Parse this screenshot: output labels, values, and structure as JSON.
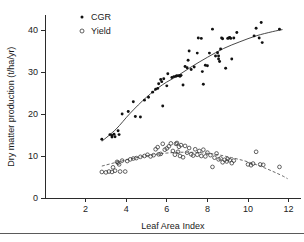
{
  "figure": {
    "background": "#ffffff",
    "frame_color": "#2b2b2b",
    "footer_rule_color": "#5a5a5a"
  },
  "chart_data": {
    "type": "scatter",
    "title": "",
    "xlabel": "Leaf Area Index",
    "ylabel": "Dry matter production (t/ha/yr)",
    "xlim": [
      0,
      12.6
    ],
    "ylim": [
      0,
      43.5
    ],
    "xticks": [
      2,
      4,
      6,
      8,
      10,
      12
    ],
    "yticks": [
      0,
      10,
      20,
      30,
      40
    ],
    "xtick_labels": [
      "2",
      "4",
      "6",
      "8",
      "10",
      "12"
    ],
    "ytick_labels": [
      "0",
      "10",
      "20",
      "30",
      "40"
    ],
    "grid": false,
    "legend_position": "top-left",
    "legend": [
      {
        "label": "CGR",
        "marker": "filled-circle",
        "color": "#111111"
      },
      {
        "label": "Yield",
        "marker": "open-circle",
        "color": "#3a3a3a"
      }
    ],
    "series": [
      {
        "name": "CGR",
        "marker": "filled-circle",
        "color": "#111111",
        "points": [
          [
            2.8,
            14.0
          ],
          [
            3.2,
            15.1
          ],
          [
            3.3,
            14.9
          ],
          [
            3.3,
            14.5
          ],
          [
            3.4,
            15.2
          ],
          [
            3.45,
            14.6
          ],
          [
            3.6,
            16.0
          ],
          [
            3.65,
            15.1
          ],
          [
            3.8,
            20.0
          ],
          [
            4.1,
            20.6
          ],
          [
            4.35,
            22.9
          ],
          [
            4.45,
            19.4
          ],
          [
            4.7,
            19.3
          ],
          [
            4.9,
            23.3
          ],
          [
            5.1,
            24.0
          ],
          [
            5.3,
            25.2
          ],
          [
            5.45,
            25.9
          ],
          [
            5.55,
            26.1
          ],
          [
            5.6,
            27.2
          ],
          [
            5.7,
            28.2
          ],
          [
            5.75,
            27.7
          ],
          [
            5.8,
            21.9
          ],
          [
            5.85,
            28.4
          ],
          [
            6.0,
            26.7
          ],
          [
            6.05,
            29.6
          ],
          [
            6.25,
            28.7
          ],
          [
            6.35,
            28.9
          ],
          [
            6.45,
            29.0
          ],
          [
            6.5,
            29.1
          ],
          [
            6.6,
            29.1
          ],
          [
            6.65,
            29.0
          ],
          [
            6.7,
            29.2
          ],
          [
            6.8,
            26.9
          ],
          [
            6.9,
            31.3
          ],
          [
            7.0,
            31.0
          ],
          [
            7.05,
            32.8
          ],
          [
            7.1,
            35.0
          ],
          [
            7.2,
            30.6
          ],
          [
            7.35,
            31.2
          ],
          [
            7.5,
            34.5
          ],
          [
            7.55,
            38.1
          ],
          [
            7.7,
            38.0
          ],
          [
            7.75,
            30.1
          ],
          [
            7.8,
            27.1
          ],
          [
            7.9,
            31.6
          ],
          [
            8.0,
            31.5
          ],
          [
            8.1,
            34.5
          ],
          [
            8.25,
            40.2
          ],
          [
            8.4,
            33.8
          ],
          [
            8.5,
            34.6
          ],
          [
            8.55,
            33.8
          ],
          [
            8.55,
            33.1
          ],
          [
            8.6,
            32.5
          ],
          [
            8.65,
            35.5
          ],
          [
            8.7,
            38.1
          ],
          [
            8.75,
            37.9
          ],
          [
            8.9,
            30.9
          ],
          [
            9.0,
            38.0
          ],
          [
            9.05,
            38.1
          ],
          [
            9.1,
            38.2
          ],
          [
            9.15,
            38.0
          ],
          [
            9.2,
            33.1
          ],
          [
            9.3,
            38.1
          ],
          [
            9.45,
            39.4
          ],
          [
            10.3,
            38.6
          ],
          [
            10.4,
            40.4
          ],
          [
            10.55,
            38.1
          ],
          [
            10.65,
            41.8
          ],
          [
            10.7,
            37.0
          ],
          [
            11.55,
            40.2
          ]
        ],
        "fit_curve_style": "solid",
        "fit_curve": [
          [
            2.8,
            13.5
          ],
          [
            3.5,
            16.4
          ],
          [
            4.2,
            20.2
          ],
          [
            5.0,
            24.0
          ],
          [
            5.8,
            27.0
          ],
          [
            6.5,
            29.0
          ],
          [
            7.2,
            31.2
          ],
          [
            8.0,
            33.5
          ],
          [
            8.8,
            35.6
          ],
          [
            9.6,
            37.2
          ],
          [
            10.4,
            38.6
          ],
          [
            11.2,
            39.6
          ],
          [
            11.7,
            40.1
          ]
        ]
      },
      {
        "name": "Yield",
        "marker": "open-circle",
        "color": "#3a3a3a",
        "points": [
          [
            2.8,
            6.2
          ],
          [
            3.0,
            6.1
          ],
          [
            3.15,
            6.3
          ],
          [
            3.3,
            6.2
          ],
          [
            3.35,
            7.3
          ],
          [
            3.45,
            6.5
          ],
          [
            3.55,
            8.6
          ],
          [
            3.6,
            8.4
          ],
          [
            3.65,
            8.0
          ],
          [
            3.7,
            6.3
          ],
          [
            3.8,
            8.9
          ],
          [
            3.95,
            6.3
          ],
          [
            4.05,
            8.8
          ],
          [
            4.2,
            9.2
          ],
          [
            4.35,
            9.4
          ],
          [
            4.5,
            9.5
          ],
          [
            4.7,
            9.8
          ],
          [
            4.9,
            10.0
          ],
          [
            5.05,
            10.3
          ],
          [
            5.2,
            9.9
          ],
          [
            5.35,
            10.2
          ],
          [
            5.45,
            11.6
          ],
          [
            5.55,
            12.1
          ],
          [
            5.6,
            10.4
          ],
          [
            5.7,
            10.5
          ],
          [
            5.8,
            12.9
          ],
          [
            5.9,
            11.5
          ],
          [
            6.0,
            11.8
          ],
          [
            6.1,
            12.3
          ],
          [
            6.2,
            13.0
          ],
          [
            6.3,
            11.2
          ],
          [
            6.4,
            10.3
          ],
          [
            6.45,
            12.9
          ],
          [
            6.5,
            13.1
          ],
          [
            6.55,
            11.0
          ],
          [
            6.6,
            12.2
          ],
          [
            6.65,
            10.0
          ],
          [
            6.7,
            12.6
          ],
          [
            6.8,
            9.7
          ],
          [
            6.9,
            12.4
          ],
          [
            7.0,
            10.8
          ],
          [
            7.1,
            11.9
          ],
          [
            7.2,
            10.4
          ],
          [
            7.3,
            10.1
          ],
          [
            7.4,
            11.6
          ],
          [
            7.5,
            10.3
          ],
          [
            7.6,
            11.2
          ],
          [
            7.7,
            10.0
          ],
          [
            7.8,
            11.5
          ],
          [
            7.9,
            9.9
          ],
          [
            8.0,
            10.8
          ],
          [
            8.15,
            10.2
          ],
          [
            8.25,
            7.4
          ],
          [
            8.35,
            9.6
          ],
          [
            8.45,
            10.6
          ],
          [
            8.55,
            9.2
          ],
          [
            8.65,
            9.4
          ],
          [
            8.75,
            8.5
          ],
          [
            8.85,
            9.1
          ],
          [
            8.95,
            8.7
          ],
          [
            9.0,
            9.3
          ],
          [
            9.1,
            9.0
          ],
          [
            9.2,
            8.3
          ],
          [
            9.3,
            8.9
          ],
          [
            10.0,
            8.0
          ],
          [
            10.15,
            7.8
          ],
          [
            10.25,
            8.2
          ],
          [
            10.4,
            11.0
          ],
          [
            10.6,
            8.0
          ],
          [
            10.75,
            7.9
          ],
          [
            11.55,
            7.4
          ]
        ],
        "fit_curve_style": "dashed",
        "fit_curve": [
          [
            2.8,
            7.6
          ],
          [
            3.6,
            8.6
          ],
          [
            4.4,
            9.5
          ],
          [
            5.2,
            10.2
          ],
          [
            6.0,
            10.7
          ],
          [
            6.8,
            10.9
          ],
          [
            7.6,
            10.8
          ],
          [
            8.4,
            10.4
          ],
          [
            9.2,
            9.6
          ],
          [
            10.0,
            8.6
          ],
          [
            10.8,
            7.2
          ],
          [
            11.6,
            5.5
          ],
          [
            11.95,
            4.6
          ]
        ]
      }
    ]
  }
}
